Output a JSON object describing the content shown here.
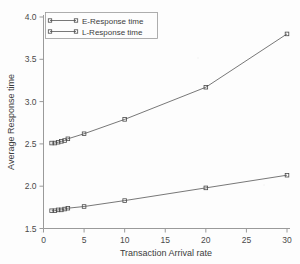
{
  "chart_data": {
    "type": "line",
    "title": "",
    "xlabel": "Transaction Arrival rate",
    "ylabel": "Average Response time",
    "xlim": [
      0,
      30
    ],
    "ylim": [
      1.5,
      4.0
    ],
    "xticks": [
      "0",
      "5",
      "10",
      "15",
      "20",
      "25",
      "30"
    ],
    "xtick_values": [
      0,
      5,
      10,
      15,
      20,
      25,
      30
    ],
    "yticks": [
      "1.5",
      "2.0",
      "2.5",
      "3.0",
      "3.5",
      "4.0"
    ],
    "ytick_values": [
      1.5,
      2.0,
      2.5,
      3.0,
      3.5,
      4.0
    ],
    "grid": false,
    "legend_position": "top-left",
    "series": [
      {
        "name": "E-Response time",
        "marker": "open-square",
        "x": [
          1,
          1.4,
          1.8,
          2.2,
          2.6,
          3,
          5,
          10,
          20,
          30
        ],
        "values": [
          1.71,
          1.71,
          1.72,
          1.72,
          1.73,
          1.74,
          1.76,
          1.83,
          1.98,
          2.13
        ]
      },
      {
        "name": "L-Response time",
        "marker": "open-square",
        "x": [
          1,
          1.4,
          1.8,
          2.2,
          2.6,
          3,
          5,
          10,
          20,
          30
        ],
        "values": [
          2.51,
          2.51,
          2.52,
          2.53,
          2.54,
          2.56,
          2.62,
          2.79,
          3.17,
          3.8
        ]
      }
    ]
  },
  "legend": {
    "items": [
      {
        "label": "E-Response time"
      },
      {
        "label": "L-Response time"
      }
    ]
  },
  "colors": {
    "line": "#555555",
    "axis": "#9a9a9a",
    "text": "#3c3c3c",
    "background": "#fdfdfd"
  }
}
